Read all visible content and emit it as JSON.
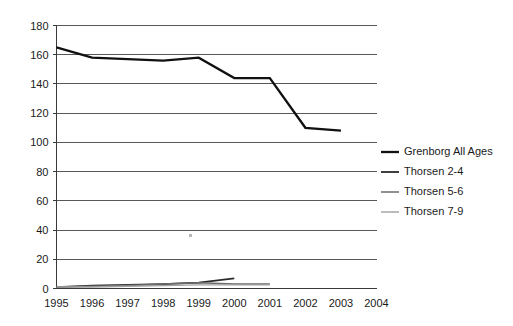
{
  "chart_data": {
    "type": "line",
    "title": "",
    "subtitle": "",
    "xlabel": "",
    "ylabel": "",
    "x": [
      1995,
      1996,
      1997,
      1998,
      1999,
      2000,
      2001,
      2002,
      2003,
      2004
    ],
    "xtick_labels": [
      "1995",
      "1996",
      "1997",
      "1998",
      "1999",
      "2000",
      "2001",
      "2002",
      "2003",
      "2004"
    ],
    "ytick_labels": [
      "0",
      "20",
      "40",
      "60",
      "80",
      "100",
      "120",
      "140",
      "160",
      "180"
    ],
    "yticks": [
      0,
      20,
      40,
      60,
      80,
      100,
      120,
      140,
      160,
      180
    ],
    "ylim": [
      0,
      180
    ],
    "xlim": [
      1995,
      2004
    ],
    "grid": "horizontal",
    "legend_position": "right",
    "series": [
      {
        "name": "Grenborg All Ages",
        "color": "#111111",
        "width": 2.3,
        "x": [
          1995,
          1996,
          1997,
          1998,
          1999,
          2000,
          2001,
          2002,
          2003
        ],
        "values": [
          165,
          158,
          157,
          156,
          158,
          144,
          144,
          110,
          108
        ]
      },
      {
        "name": "Thorsen 2-4",
        "color": "#2b2b2b",
        "width": 1.8,
        "x": [
          1995,
          1996,
          1997,
          1998,
          1999,
          2000
        ],
        "values": [
          1,
          2,
          2.5,
          3,
          4,
          7
        ]
      },
      {
        "name": "Thorsen 5-6",
        "color": "#6b6b6b",
        "width": 1.5,
        "x": [
          1995,
          1996,
          1997,
          1998,
          1999,
          2000,
          2001
        ],
        "values": [
          1,
          1.5,
          2,
          3,
          4,
          3,
          3
        ]
      },
      {
        "name": "Thorsen 7-9",
        "color": "#a0a0a0",
        "width": 1.4,
        "x": [
          1995,
          1996,
          1997,
          1998,
          1999,
          2000,
          2001
        ],
        "values": [
          1,
          1,
          1.5,
          2,
          2.5,
          2.5,
          2.5
        ]
      }
    ]
  },
  "legend": {
    "items": [
      {
        "label": "Grenborg All Ages",
        "color": "#111111",
        "width": 2.3
      },
      {
        "label": "Thorsen 2-4",
        "color": "#2b2b2b",
        "width": 1.8
      },
      {
        "label": "Thorsen 5-6",
        "color": "#6b6b6b",
        "width": 1.5
      },
      {
        "label": "Thorsen 7-9",
        "color": "#a0a0a0",
        "width": 1.4
      }
    ]
  }
}
